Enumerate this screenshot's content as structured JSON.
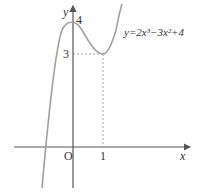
{
  "figure": {
    "equation_label": "y=2x³−3x²+4",
    "axis_labels": {
      "x": "x",
      "y": "y"
    },
    "origin_label": "O",
    "tick_labels": {
      "x_one": "1",
      "y_four": "4",
      "y_three": "3"
    }
  },
  "colors": {
    "curve": "#a0a0a0",
    "axis": "#555555",
    "dashed": "#888888"
  },
  "function": {
    "expression": "2x^3-3x^2+4",
    "local_max": {
      "x": 0,
      "y": 4
    },
    "local_min": {
      "x": 1,
      "y": 3
    }
  }
}
